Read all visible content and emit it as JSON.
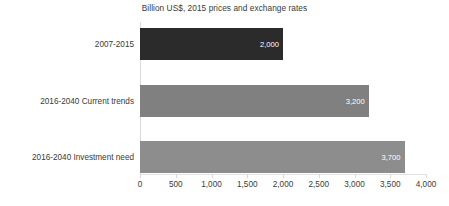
{
  "chart_data": {
    "type": "bar",
    "orientation": "horizontal",
    "title": "Billion US$, 2015 prices and exchange rates",
    "xlabel": "",
    "ylabel": "",
    "xlim": [
      0,
      4000
    ],
    "xticks": [
      0,
      500,
      1000,
      1500,
      2000,
      2500,
      3000,
      3500,
      4000
    ],
    "xtick_labels": [
      "0",
      "500",
      "1,000",
      "1,500",
      "2,000",
      "2,500",
      "3,000",
      "3,500",
      "4,000"
    ],
    "grid": false,
    "legend": "none",
    "categories": [
      "2007-2015",
      "2016-2040 Current trends",
      "2016-2040 Investment need"
    ],
    "values": [
      2000,
      3200,
      3700
    ],
    "data_labels": [
      "2,000",
      "3,200",
      "3,700"
    ],
    "bar_colors": [
      "#2b2b2b",
      "#808080",
      "#8d8d8d"
    ],
    "data_label_color": "#ffffff",
    "bars": [
      {
        "category": "2007-2015",
        "value": 2000,
        "label": "2,000",
        "color": "#2b2b2b"
      },
      {
        "category": "2016-2040 Current trends",
        "value": 3200,
        "label": "3,200",
        "color": "#808080"
      },
      {
        "category": "2016-2040 Investment need",
        "value": 3700,
        "label": "3,700",
        "color": "#8d8d8d"
      }
    ]
  }
}
